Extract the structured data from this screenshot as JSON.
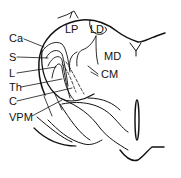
{
  "diagram": {
    "type": "anatomical-line-drawing",
    "left_labels": [
      {
        "id": "Ca",
        "text": "Ca",
        "x": 9,
        "y": 33
      },
      {
        "id": "S",
        "text": "S",
        "x": 9,
        "y": 52
      },
      {
        "id": "L",
        "text": "L",
        "x": 9,
        "y": 68
      },
      {
        "id": "Th",
        "text": "Th",
        "x": 9,
        "y": 82
      },
      {
        "id": "C",
        "text": "C",
        "x": 9,
        "y": 96
      },
      {
        "id": "VPM",
        "text": "VPM",
        "x": 9,
        "y": 112
      }
    ],
    "region_labels": [
      {
        "id": "LP",
        "text": "LP",
        "x": 65,
        "y": 24
      },
      {
        "id": "LD",
        "text": "LD",
        "x": 90,
        "y": 24
      },
      {
        "id": "MD",
        "text": "MD",
        "x": 104,
        "y": 51
      },
      {
        "id": "CM",
        "text": "CM",
        "x": 101,
        "y": 69
      }
    ],
    "stroke_color": "#111111",
    "background": "#ffffff"
  }
}
